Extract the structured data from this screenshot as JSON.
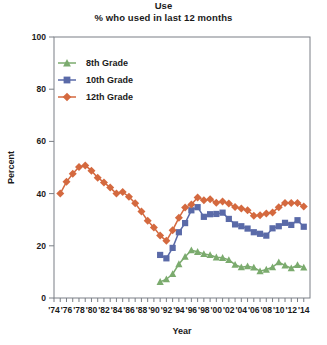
{
  "chart_data": {
    "type": "line",
    "title": "Use",
    "subtitle": "% who used in last 12 months",
    "xlabel": "Year",
    "ylabel": "Percent",
    "ylim": [
      0,
      100
    ],
    "yticks": [
      0,
      20,
      40,
      60,
      80,
      100
    ],
    "xlim": [
      1974,
      2015
    ],
    "xticks": [
      1974,
      1975,
      1976,
      1977,
      1978,
      1979,
      1980,
      1981,
      1982,
      1983,
      1984,
      1985,
      1986,
      1987,
      1988,
      1989,
      1990,
      1991,
      1992,
      1993,
      1994,
      1995,
      1996,
      1997,
      1998,
      1999,
      2000,
      2001,
      2002,
      2003,
      2004,
      2005,
      2006,
      2007,
      2008,
      2009,
      2010,
      2011,
      2012,
      2013,
      2014
    ],
    "xticklabels": [
      "'74",
      "'76",
      "'78",
      "'80",
      "'82",
      "'84",
      "'86",
      "'88",
      "'90",
      "'92",
      "'94",
      "'96",
      "'98",
      "'00",
      "'02",
      "'04",
      "'06",
      "'08",
      "'10",
      "'12",
      "'14"
    ],
    "xticklabel_years": [
      1974,
      1976,
      1978,
      1980,
      1982,
      1984,
      1986,
      1988,
      1990,
      1992,
      1994,
      1996,
      1998,
      2000,
      2002,
      2004,
      2006,
      2008,
      2010,
      2012,
      2014
    ],
    "grid": false,
    "legend_position": "upper-left-inside",
    "series": [
      {
        "name": "8th Grade",
        "color": "#7bab6e",
        "marker": "triangle",
        "x": [
          1991,
          1992,
          1993,
          1994,
          1995,
          1996,
          1997,
          1998,
          1999,
          2000,
          2001,
          2002,
          2003,
          2004,
          2005,
          2006,
          2007,
          2008,
          2009,
          2010,
          2011,
          2012,
          2013,
          2014
        ],
        "y": [
          6.2,
          7.2,
          9.2,
          13.0,
          15.8,
          18.3,
          17.7,
          16.9,
          16.5,
          15.6,
          15.4,
          14.6,
          12.8,
          11.8,
          12.2,
          11.7,
          10.3,
          10.9,
          11.8,
          13.7,
          12.5,
          11.4,
          12.7,
          11.7
        ]
      },
      {
        "name": "10th Grade",
        "color": "#5a6aa8",
        "marker": "square",
        "x": [
          1991,
          1992,
          1993,
          1994,
          1995,
          1996,
          1997,
          1998,
          1999,
          2000,
          2001,
          2002,
          2003,
          2004,
          2005,
          2006,
          2007,
          2008,
          2009,
          2010,
          2011,
          2012,
          2013,
          2014
        ],
        "y": [
          16.5,
          15.2,
          19.2,
          25.2,
          28.7,
          33.6,
          34.8,
          31.1,
          32.1,
          32.2,
          32.7,
          30.3,
          28.2,
          27.5,
          26.6,
          25.2,
          24.6,
          23.9,
          26.7,
          27.5,
          28.8,
          28.0,
          29.8,
          27.3
        ]
      },
      {
        "name": "12th Grade",
        "color": "#d4693f",
        "marker": "diamond",
        "x": [
          1975,
          1976,
          1977,
          1978,
          1979,
          1980,
          1981,
          1982,
          1983,
          1984,
          1985,
          1986,
          1987,
          1988,
          1989,
          1990,
          1991,
          1992,
          1993,
          1994,
          1995,
          1996,
          1997,
          1998,
          1999,
          2000,
          2001,
          2002,
          2003,
          2004,
          2005,
          2006,
          2007,
          2008,
          2009,
          2010,
          2011,
          2012,
          2013,
          2014
        ],
        "y": [
          40.0,
          44.5,
          47.6,
          50.2,
          50.8,
          48.8,
          46.1,
          44.3,
          42.3,
          40.0,
          40.6,
          38.8,
          36.3,
          33.1,
          29.6,
          27.0,
          23.9,
          21.9,
          26.0,
          30.7,
          34.7,
          35.8,
          38.5,
          37.5,
          37.8,
          36.5,
          37.0,
          36.2,
          34.9,
          34.3,
          33.6,
          31.5,
          31.7,
          32.4,
          32.8,
          34.8,
          36.4,
          36.4,
          36.4,
          35.1
        ]
      }
    ],
    "legend": [
      {
        "label": "8th Grade",
        "color": "#7bab6e",
        "marker": "triangle"
      },
      {
        "label": "10th Grade",
        "color": "#5a6aa8",
        "marker": "square"
      },
      {
        "label": "12th Grade",
        "color": "#d4693f",
        "marker": "diamond"
      }
    ]
  }
}
